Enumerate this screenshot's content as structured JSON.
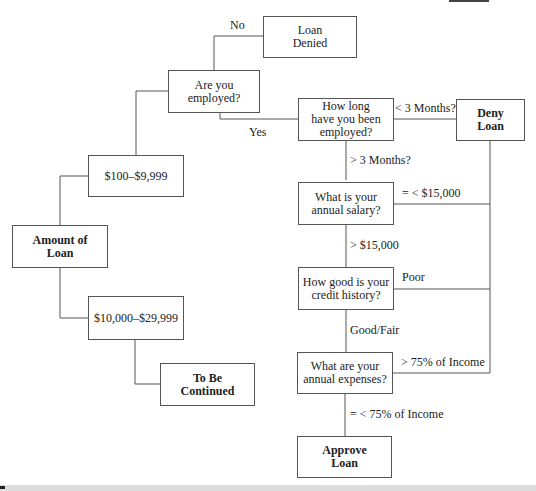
{
  "diagram": {
    "type": "flowchart-tree",
    "nodes": {
      "amount": {
        "label": "Amount of\nLoan",
        "bold": true
      },
      "range_low": {
        "label": "$100–$9,999"
      },
      "range_high": {
        "label": "$10,000–$29,999"
      },
      "continued": {
        "label": "To Be\nContinued",
        "bold": true
      },
      "employed": {
        "label": "Are you\nemployed?"
      },
      "loan_denied": {
        "label": "Loan\nDenied"
      },
      "how_long": {
        "label": "How long\nhave you been\nemployed?"
      },
      "deny_loan": {
        "label": "Deny\nLoan",
        "bold": true
      },
      "salary": {
        "label": "What is your\nannual salary?"
      },
      "credit": {
        "label": "How good is your\ncredit history?"
      },
      "expenses": {
        "label": "What are your\nannual expenses?"
      },
      "approve": {
        "label": "Approve\nLoan",
        "bold": true
      }
    },
    "edges": {
      "no": "No",
      "yes": "Yes",
      "lt3": "< 3 Months?",
      "gt3": "> 3 Months?",
      "sal_low": "= < $15,000",
      "sal_high": "> $15,000",
      "poor": "Poor",
      "goodfair": "Good/Fair",
      "exp_high": "> 75% of Income",
      "exp_low": "= < 75% of Income"
    }
  }
}
